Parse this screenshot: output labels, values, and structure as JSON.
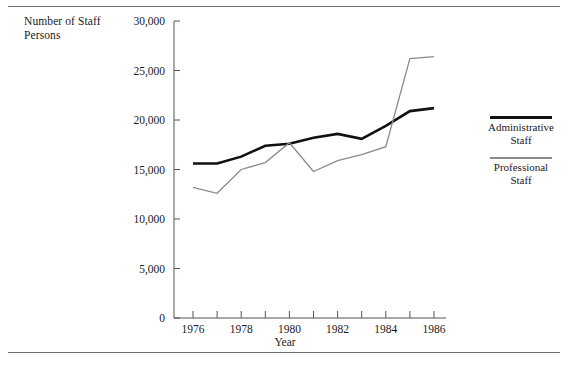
{
  "figure": {
    "y_axis_caption": "Number of Staff Persons",
    "x_axis_title": "Year",
    "rule_color": "#6e6e6e"
  },
  "legend": {
    "position": "right",
    "entries": [
      {
        "label_line1": "Administrative",
        "label_line2": "Staff",
        "color": "#111111",
        "style": "thick-black"
      },
      {
        "label_line1": "Professional",
        "label_line2": "Staff",
        "color": "#8a8a8a",
        "style": "thin-gray"
      }
    ]
  },
  "chart_data": {
    "type": "line",
    "title": "",
    "xlabel": "Year",
    "ylabel": "Number of Staff Persons",
    "x": [
      1976,
      1977,
      1978,
      1979,
      1980,
      1981,
      1982,
      1983,
      1984,
      1985,
      1986
    ],
    "xlim": [
      1975.5,
      1986.5
    ],
    "ylim": [
      0,
      30000
    ],
    "yticks": [
      0,
      5000,
      10000,
      15000,
      20000,
      25000,
      30000
    ],
    "ytick_labels": [
      "0",
      "5,000",
      "10,000",
      "15,000",
      "20,000",
      "25,000",
      "30,000"
    ],
    "xticks": [
      1976,
      1977,
      1978,
      1979,
      1980,
      1981,
      1982,
      1983,
      1984,
      1985,
      1986
    ],
    "xtick_labels": [
      "1976",
      "",
      "1978",
      "",
      "1980",
      "",
      "1982",
      "",
      "1984",
      "",
      "1986"
    ],
    "grid": false,
    "legend_position": "right",
    "series": [
      {
        "name": "Administrative Staff",
        "color": "#111111",
        "width": 2.6,
        "values": [
          15600,
          15600,
          16300,
          17400,
          17600,
          18200,
          18600,
          18100,
          19400,
          20900,
          21200
        ]
      },
      {
        "name": "Professional Staff",
        "color": "#8a8a8a",
        "width": 1.3,
        "values": [
          13200,
          12600,
          15000,
          15700,
          17700,
          14800,
          15900,
          16500,
          17300,
          26200,
          26400
        ]
      }
    ]
  }
}
